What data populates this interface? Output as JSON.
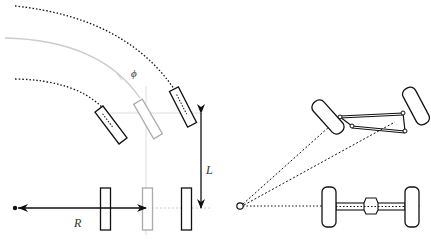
{
  "diagram": {
    "labels": {
      "phi": "ϕ",
      "wheelbase": "L",
      "radius": "R"
    },
    "colors": {
      "ink": "#111111",
      "guide": "#cccccc",
      "ghost": "#aaaaaa"
    },
    "left_panel": {
      "description": "Bicycle model: rear axle wheels, front steered wheels, turning arcs"
    },
    "right_panel": {
      "description": "Four-wheel chassis with tie-rod linkage converging on turn center"
    }
  }
}
